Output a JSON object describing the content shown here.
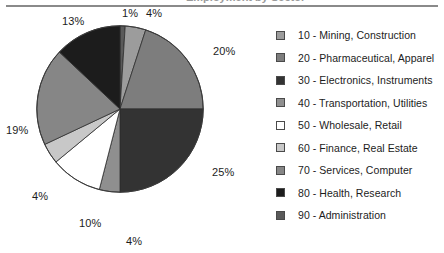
{
  "page": {
    "title_sliver": "Employment by Sector",
    "background": "#ffffff",
    "rule_color": "#8a8a8a"
  },
  "chart_data": {
    "type": "pie",
    "title": "",
    "xlabel": "",
    "ylabel": "",
    "legend_position": "right",
    "grid": false,
    "units": "percent",
    "start_angle_deg": 0,
    "direction": "clockwise",
    "categories": [
      "10 - Mining, Construction",
      "20 - Pharmaceutical, Apparel",
      "30 - Electronics, Instruments",
      "40 - Transportation, Utilities",
      "50 - Wholesale, Retail",
      "60 - Finance, Real Estate",
      "70 - Services, Computer",
      "80 - Health, Research",
      "90 - Administration"
    ],
    "values": [
      4,
      20,
      25,
      4,
      10,
      4,
      19,
      13,
      1
    ],
    "labels": [
      "4%",
      "20%",
      "25%",
      "4%",
      "10%",
      "4%",
      "19%",
      "13%",
      "1%"
    ],
    "colors": [
      "#9c9c9c",
      "#7d7d7d",
      "#333333",
      "#8f8f8f",
      "#ffffff",
      "#c8c8c8",
      "#868686",
      "#1c1c1c",
      "#5a5a5a"
    ],
    "slice_order_clockwise_from_top": [
      {
        "label": "1%",
        "value": 1,
        "category": "90 - Administration",
        "color": "#5a5a5a"
      },
      {
        "label": "4%",
        "value": 4,
        "category": "10 - Mining, Construction",
        "color": "#9c9c9c"
      },
      {
        "label": "20%",
        "value": 20,
        "category": "20 - Pharmaceutical, Apparel",
        "color": "#7d7d7d"
      },
      {
        "label": "25%",
        "value": 25,
        "category": "30 - Electronics, Instruments",
        "color": "#333333"
      },
      {
        "label": "4%",
        "value": 4,
        "category": "40 - Transportation, Utilities",
        "color": "#8f8f8f"
      },
      {
        "label": "10%",
        "value": 10,
        "category": "50 - Wholesale, Retail",
        "color": "#ffffff"
      },
      {
        "label": "4%",
        "value": 4,
        "category": "60 - Finance, Real Estate",
        "color": "#c8c8c8"
      },
      {
        "label": "19%",
        "value": 19,
        "category": "70 - Services, Computer",
        "color": "#868686"
      },
      {
        "label": "13%",
        "value": 13,
        "category": "80 - Health, Research",
        "color": "#1c1c1c"
      }
    ]
  },
  "slice_labels": {
    "top_left": "1%",
    "top_right": "4%",
    "right_upper": "20%",
    "right_lower": "25%",
    "bottom": "4%",
    "bottom_left": "10%",
    "left_lower": "4%",
    "left": "19%",
    "left_upper": "13%"
  },
  "legend": {
    "items": [
      {
        "label": "10 - Mining, Construction",
        "color": "#9c9c9c"
      },
      {
        "label": "20 - Pharmaceutical, Apparel",
        "color": "#7d7d7d"
      },
      {
        "label": "30 - Electronics, Instruments",
        "color": "#333333"
      },
      {
        "label": "40 - Transportation, Utilities",
        "color": "#8f8f8f"
      },
      {
        "label": "50 - Wholesale, Retail",
        "color": "#ffffff"
      },
      {
        "label": "60 - Finance, Real Estate",
        "color": "#c8c8c8"
      },
      {
        "label": "70 - Services, Computer",
        "color": "#868686"
      },
      {
        "label": "80 - Health, Research",
        "color": "#1c1c1c"
      },
      {
        "label": "90 - Administration",
        "color": "#5a5a5a"
      }
    ]
  }
}
